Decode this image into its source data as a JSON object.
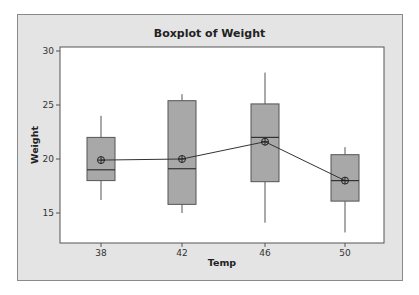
{
  "chart_data": {
    "type": "boxplot",
    "title": "Boxplot of Weight",
    "xlabel": "Temp",
    "ylabel": "Weight",
    "categories": [
      "38",
      "42",
      "46",
      "50"
    ],
    "ylim": [
      12.3,
      30.3
    ],
    "yticks": [
      15,
      20,
      25,
      30
    ],
    "grid": false,
    "legend": null,
    "boxes": [
      {
        "category": "38",
        "whisker_low": 16.2,
        "q1": 18.0,
        "median": 19.0,
        "q3": 22.0,
        "whisker_high": 24.0,
        "mean": 19.9
      },
      {
        "category": "42",
        "whisker_low": 15.0,
        "q1": 15.8,
        "median": 19.1,
        "q3": 25.4,
        "whisker_high": 26.0,
        "mean": 20.0
      },
      {
        "category": "46",
        "whisker_low": 14.1,
        "q1": 17.9,
        "median": 22.0,
        "q3": 25.1,
        "whisker_high": 28.0,
        "mean": 21.6
      },
      {
        "category": "50",
        "whisker_low": 13.2,
        "q1": 16.1,
        "median": 18.0,
        "q3": 20.4,
        "whisker_high": 21.1,
        "mean": 18.0
      }
    ],
    "mean_line": {
      "connected": true,
      "marker": "circle-plus"
    },
    "colors": {
      "box_fill": "#a8a8a8",
      "box_edge": "#555555",
      "frame_bg": "#e4e4e4",
      "plot_bg": "#ffffff",
      "line": "#333333"
    }
  },
  "header": {
    "title": "Boxplot of Weight"
  },
  "axes": {
    "x_label": "Temp",
    "y_label": "Weight",
    "x_ticks": [
      "38",
      "42",
      "46",
      "50"
    ],
    "y_ticks": [
      "15",
      "20",
      "25",
      "30"
    ]
  }
}
